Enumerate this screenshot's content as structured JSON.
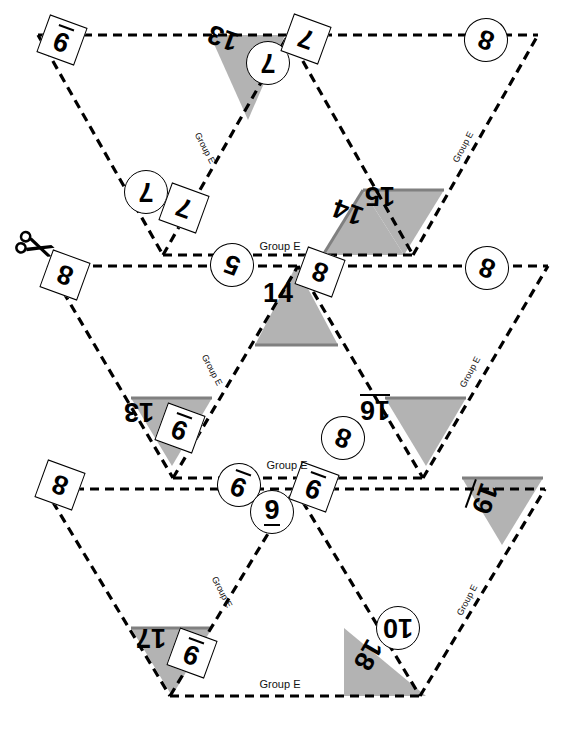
{
  "document": {
    "title": "Flexagon Cut-Out Template",
    "group_label": "Group E",
    "background_color": "#ffffff",
    "line_color": "#000000",
    "shade_color": "#b3b3b3",
    "shade_edge_color": "#808080"
  },
  "icons": {
    "scissors": "scissors-icon"
  },
  "group_labels": [
    {
      "id": "g-top-left-edge",
      "text": "Group E",
      "x": 205,
      "y": 148,
      "rot": 62,
      "size": 9
    },
    {
      "id": "g-top-right-edge",
      "text": "Group E",
      "x": 463,
      "y": 147,
      "rot": -62,
      "size": 9
    },
    {
      "id": "g-top-bottom-run",
      "text": "Group E",
      "x": 280,
      "y": 246,
      "rot": 0,
      "size": 11
    },
    {
      "id": "g-mid-left-edge",
      "text": "Group E",
      "x": 212,
      "y": 370,
      "rot": 62,
      "size": 9
    },
    {
      "id": "g-mid-right-edge",
      "text": "Group E",
      "x": 470,
      "y": 372,
      "rot": -62,
      "size": 9
    },
    {
      "id": "g-mid-bottom-run",
      "text": "Group E",
      "x": 287,
      "y": 465,
      "rot": 0,
      "size": 11
    },
    {
      "id": "g-bot-left-edge",
      "text": "Group E",
      "x": 222,
      "y": 592,
      "rot": 62,
      "size": 9
    },
    {
      "id": "g-bot-right-edge",
      "text": "Group E",
      "x": 467,
      "y": 600,
      "rot": -62,
      "size": 9
    },
    {
      "id": "g-bot-bottom-run",
      "text": "Group E",
      "x": 280,
      "y": 684,
      "rot": 0,
      "size": 11
    }
  ],
  "labels": [
    {
      "id": "l-9-tl",
      "value": "9",
      "shape": "square",
      "rot": 200,
      "x": 62,
      "y": 40,
      "w": 40,
      "h": 40,
      "size": 27,
      "underline": true
    },
    {
      "id": "l-13-t",
      "value": "13",
      "shape": "plain",
      "rot": 200,
      "x": 223,
      "y": 38,
      "w": 46,
      "h": 34,
      "size": 27,
      "underline": false
    },
    {
      "id": "l-7-tc",
      "value": "7",
      "shape": "circle",
      "rot": 180,
      "x": 268,
      "y": 63,
      "w": 44,
      "h": 44,
      "size": 27,
      "underline": false
    },
    {
      "id": "l-7-tr",
      "value": "7",
      "shape": "square",
      "rot": 200,
      "x": 306,
      "y": 39,
      "w": 40,
      "h": 40,
      "size": 27,
      "underline": false
    },
    {
      "id": "l-8-tr",
      "value": "8",
      "shape": "circle",
      "rot": 200,
      "x": 486,
      "y": 40,
      "w": 44,
      "h": 44,
      "size": 27,
      "underline": false
    },
    {
      "id": "l-7-ml",
      "value": "7",
      "shape": "circle",
      "rot": 180,
      "x": 146,
      "y": 192,
      "w": 44,
      "h": 44,
      "size": 27,
      "underline": false
    },
    {
      "id": "l-7-ms",
      "value": "7",
      "shape": "square",
      "rot": 200,
      "x": 184,
      "y": 208,
      "w": 40,
      "h": 40,
      "size": 27,
      "underline": false
    },
    {
      "id": "l-15-t",
      "value": "15",
      "shape": "plain",
      "rot": 180,
      "x": 380,
      "y": 196,
      "w": 46,
      "h": 34,
      "size": 27,
      "underline": false
    },
    {
      "id": "l-14-t",
      "value": "14",
      "shape": "plain",
      "rot": 200,
      "x": 348,
      "y": 212,
      "w": 46,
      "h": 34,
      "size": 27,
      "underline": false
    },
    {
      "id": "l-8-ml",
      "value": "8",
      "shape": "square",
      "rot": 200,
      "x": 65,
      "y": 275,
      "w": 40,
      "h": 40,
      "size": 27,
      "underline": false
    },
    {
      "id": "l-5-mc",
      "value": "5",
      "shape": "circle",
      "rot": 200,
      "x": 232,
      "y": 265,
      "w": 44,
      "h": 44,
      "size": 27,
      "underline": false
    },
    {
      "id": "l-14-mc",
      "value": "14",
      "shape": "plain",
      "rot": 0,
      "x": 278,
      "y": 293,
      "w": 46,
      "h": 34,
      "size": 27,
      "underline": false
    },
    {
      "id": "l-8-mcr",
      "value": "8",
      "shape": "square",
      "rot": 200,
      "x": 320,
      "y": 272,
      "w": 40,
      "h": 40,
      "size": 27,
      "underline": false
    },
    {
      "id": "l-8-mr",
      "value": "8",
      "shape": "circle",
      "rot": 200,
      "x": 487,
      "y": 268,
      "w": 44,
      "h": 44,
      "size": 27,
      "underline": false
    },
    {
      "id": "l-13-mb",
      "value": "13",
      "shape": "plain",
      "rot": 180,
      "x": 139,
      "y": 412,
      "w": 46,
      "h": 34,
      "size": 27,
      "underline": false
    },
    {
      "id": "l-9-mb",
      "value": "9",
      "shape": "square",
      "rot": 200,
      "x": 180,
      "y": 428,
      "w": 40,
      "h": 40,
      "size": 27,
      "underline": true
    },
    {
      "id": "l-16-mb",
      "value": "16",
      "shape": "plain",
      "rot": 180,
      "x": 375,
      "y": 408,
      "w": 46,
      "h": 34,
      "size": 27,
      "underline": true
    },
    {
      "id": "l-8-mbc",
      "value": "8",
      "shape": "circle",
      "rot": 200,
      "x": 343,
      "y": 438,
      "w": 44,
      "h": 44,
      "size": 27,
      "underline": false
    },
    {
      "id": "l-8-bl",
      "value": "8",
      "shape": "square",
      "rot": 200,
      "x": 60,
      "y": 485,
      "w": 40,
      "h": 40,
      "size": 27,
      "underline": false
    },
    {
      "id": "l-9-bc1",
      "value": "9",
      "shape": "circle",
      "rot": 200,
      "x": 239,
      "y": 485,
      "w": 44,
      "h": 44,
      "size": 27,
      "underline": true
    },
    {
      "id": "l-9-bc2",
      "value": "9",
      "shape": "circle",
      "rot": 0,
      "x": 272,
      "y": 512,
      "w": 44,
      "h": 44,
      "size": 27,
      "underline": true
    },
    {
      "id": "l-9-bc3",
      "value": "9",
      "shape": "square",
      "rot": 200,
      "x": 314,
      "y": 487,
      "w": 40,
      "h": 40,
      "size": 27,
      "underline": true
    },
    {
      "id": "l-19-br",
      "value": "19",
      "shape": "plain",
      "rot": 110,
      "x": 483,
      "y": 498,
      "w": 46,
      "h": 34,
      "size": 27,
      "underline": true
    },
    {
      "id": "l-17-bb",
      "value": "17",
      "shape": "plain",
      "rot": 180,
      "x": 151,
      "y": 638,
      "w": 46,
      "h": 34,
      "size": 27,
      "underline": false
    },
    {
      "id": "l-9-bb",
      "value": "9",
      "shape": "square",
      "rot": 200,
      "x": 192,
      "y": 653,
      "w": 40,
      "h": 40,
      "size": 27,
      "underline": true
    },
    {
      "id": "l-18-bb",
      "value": "18",
      "shape": "plain",
      "rot": 120,
      "x": 368,
      "y": 655,
      "w": 46,
      "h": 34,
      "size": 27,
      "underline": false
    },
    {
      "id": "l-10-bb",
      "value": "10",
      "shape": "circle",
      "rot": 180,
      "x": 398,
      "y": 628,
      "w": 44,
      "h": 44,
      "size": 27,
      "underline": false
    }
  ],
  "shaded_regions": [
    {
      "id": "shade-13-top",
      "points": "210,35 285,35 248,120"
    },
    {
      "id": "shade-15-top",
      "points": "363,190 444,190 404,255"
    },
    {
      "id": "shade-14-top",
      "points": "363,190 404,255 323,255"
    },
    {
      "id": "shade-14-mid",
      "points": "296,266 338,345 255,345"
    },
    {
      "id": "shade-13-mid",
      "points": "131,398 212,398 172,466"
    },
    {
      "id": "shade-16-mid",
      "points": "385,398 466,398 426,466"
    },
    {
      "id": "shade-19-bot",
      "points": "462,478 543,478 502,545"
    },
    {
      "id": "shade-17-bot",
      "points": "131,628 212,628 172,696"
    },
    {
      "id": "shade-18-bot",
      "points": "344,628 426,696 344,696"
    }
  ],
  "solid_edges": [
    {
      "id": "solid-14-mid-base",
      "x1": 255,
      "y1": 345,
      "x2": 338,
      "y2": 345
    },
    {
      "id": "solid-13-mid-top",
      "x1": 131,
      "y1": 398,
      "x2": 212,
      "y2": 398
    },
    {
      "id": "solid-16-mid-top",
      "x1": 385,
      "y1": 398,
      "x2": 466,
      "y2": 398
    },
    {
      "id": "solid-15-top-top",
      "x1": 363,
      "y1": 190,
      "x2": 444,
      "y2": 190
    },
    {
      "id": "solid-14-top-left",
      "x1": 363,
      "y1": 190,
      "x2": 323,
      "y2": 255
    },
    {
      "id": "solid-17-bot-top",
      "x1": 131,
      "y1": 628,
      "x2": 212,
      "y2": 628
    },
    {
      "id": "solid-19-bot-top",
      "x1": 462,
      "y1": 478,
      "x2": 543,
      "y2": 478
    }
  ]
}
